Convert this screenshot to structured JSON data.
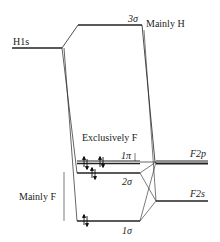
{
  "diagram": {
    "type": "molecular-orbital-energy-diagram",
    "atomic_orbitals": {
      "left": [
        {
          "label": "H1s"
        }
      ],
      "right": [
        {
          "label": "F2p"
        },
        {
          "label": "F2s"
        }
      ]
    },
    "molecular_orbitals": [
      {
        "label": "3σ",
        "annotation": "Mainly H",
        "electrons": 0
      },
      {
        "label": "1π",
        "annotation": "Exclusively F",
        "electrons": 4
      },
      {
        "label": "2σ",
        "electrons": 2
      },
      {
        "label": "1σ",
        "electrons": 2
      }
    ],
    "bracket_label": "Mainly F"
  },
  "labels": {
    "h1s": "H1s",
    "sigma3": "3σ",
    "mainly_h": "Mainly H",
    "exclusively_f": "Exclusively F",
    "pi1": "1π",
    "sigma2": "2σ",
    "sigma1": "1σ",
    "f2p": "F2p",
    "f2s": "F2s",
    "mainly_f": "Mainly F"
  }
}
